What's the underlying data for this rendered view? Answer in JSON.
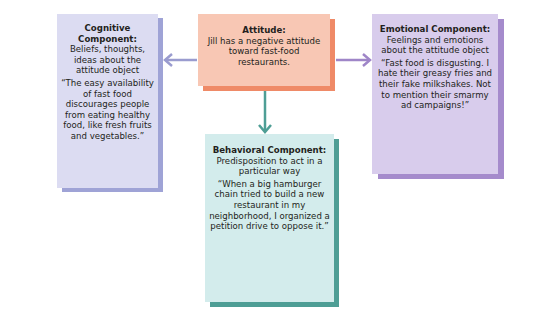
{
  "diagram": {
    "attitude": {
      "title": "Attitude:",
      "description": "Jill has a negative attitude toward fast-food restaurants."
    },
    "cognitive": {
      "title": "Cognitive Component:",
      "description": "Beliefs, thoughts, ideas about the attitude object",
      "quote": "“The easy availability of fast food discourages people from eating healthy food, like fresh fruits and vegetables.”"
    },
    "emotional": {
      "title": "Emotional Component:",
      "description": "Feelings and emotions about the attitude object",
      "quote": "“Fast food is disgusting. I hate their greasy fries and their fake milkshakes. Not to mention their smarmy ad campaigns!”"
    },
    "behavioral": {
      "title": "Behavioral Component:",
      "description": "Predisposition to act in a particular way",
      "quote": "“When a big hamburger chain tried to build a new restaurant in my neighborhood, I organized a petition drive to oppose it.”"
    },
    "colors": {
      "attitude_fill": "#f8c7b4",
      "attitude_shadow": "#ef8a67",
      "cognitive_fill": "#dcdcf2",
      "cognitive_shadow": "#9fa3d6",
      "emotional_fill": "#d8ccec",
      "emotional_shadow": "#a58bcc",
      "behavioral_fill": "#d3ecec",
      "behavioral_shadow": "#4e9e95",
      "arrow_left": "#9a9ccf",
      "arrow_right": "#9f86c8",
      "arrow_down": "#4e9e95"
    }
  }
}
